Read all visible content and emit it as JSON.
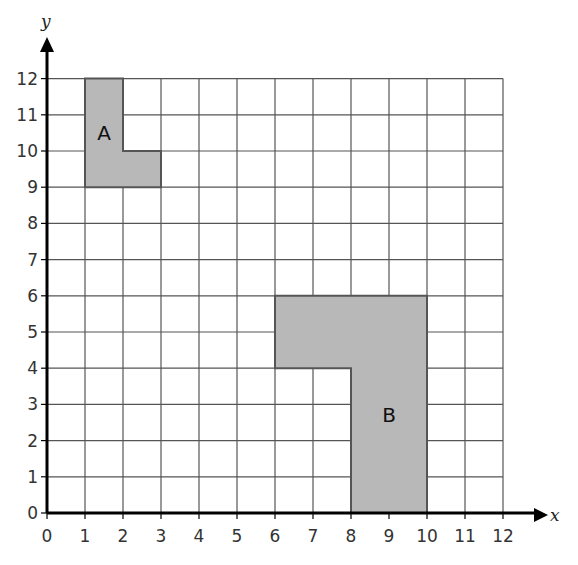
{
  "diagram": {
    "type": "coordinate-grid",
    "x_axis": {
      "label": "x",
      "min": 0,
      "max": 12,
      "ticks": [
        "0",
        "1",
        "2",
        "3",
        "4",
        "5",
        "6",
        "7",
        "8",
        "9",
        "10",
        "11",
        "12"
      ]
    },
    "y_axis": {
      "label": "y",
      "min": 0,
      "max": 12,
      "ticks": [
        "0",
        "1",
        "2",
        "3",
        "4",
        "5",
        "6",
        "7",
        "8",
        "9",
        "10",
        "11",
        "12"
      ]
    },
    "colors": {
      "grid_line": "#555555",
      "axis": "#000000",
      "shape_fill": "#b8b8b8",
      "shape_stroke": "#555555",
      "background": "#ffffff"
    },
    "shapes": [
      {
        "name": "A",
        "label": "A",
        "label_position": [
          1.5,
          10.5
        ],
        "vertices": [
          [
            1,
            12
          ],
          [
            2,
            12
          ],
          [
            2,
            10
          ],
          [
            3,
            10
          ],
          [
            3,
            9
          ],
          [
            1,
            9
          ]
        ]
      },
      {
        "name": "B",
        "label": "B",
        "label_position": [
          9,
          2.7
        ],
        "vertices": [
          [
            6,
            6
          ],
          [
            10,
            6
          ],
          [
            10,
            0
          ],
          [
            8,
            0
          ],
          [
            8,
            4
          ],
          [
            6,
            4
          ]
        ]
      }
    ]
  }
}
